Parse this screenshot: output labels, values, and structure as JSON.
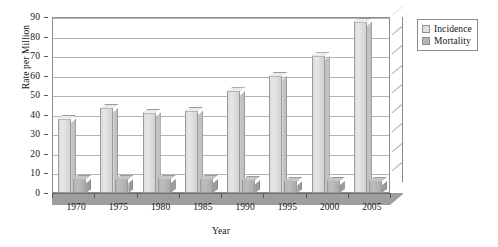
{
  "chart_data": {
    "type": "bar",
    "title": "",
    "subtitle": "",
    "xlabel": "Year",
    "ylabel": "Rate per Million",
    "categories": [
      "1970",
      "1975",
      "1980",
      "1985",
      "1990",
      "1995",
      "2000",
      "2005"
    ],
    "series": [
      {
        "name": "Incidence",
        "color": "#e0e0e0",
        "values": [
          38,
          43.5,
          41,
          42,
          52,
          60,
          70,
          87.5
        ]
      },
      {
        "name": "Mortality",
        "color": "#b5b5b5",
        "values": [
          7,
          7,
          7,
          7,
          6.5,
          6,
          6,
          6
        ]
      }
    ],
    "ylim": [
      0,
      90
    ],
    "y_ticks": [
      "0",
      "10",
      "20",
      "30",
      "40",
      "50",
      "60",
      "70",
      "80",
      "90"
    ],
    "y_tick_values": [
      0,
      10,
      20,
      30,
      40,
      50,
      60,
      70,
      80,
      90
    ],
    "grid": true,
    "grid_axis": "y",
    "legend_position": "right",
    "style": "3d-column",
    "background_color": "#ffffff",
    "axis_color": "#8c8c8c",
    "gridline_color": "#b4b4b4",
    "floor_color": "#9e9e9e"
  },
  "legend": {
    "items": [
      {
        "label": "Incidence",
        "color": "#e0e0e0"
      },
      {
        "label": "Mortality",
        "color": "#b5b5b5"
      }
    ]
  },
  "axes": {
    "y_title": "Rate per Million",
    "x_title": "Year"
  }
}
